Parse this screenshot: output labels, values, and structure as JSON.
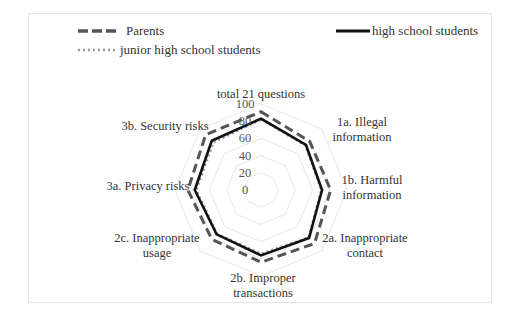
{
  "chart_data": {
    "type": "radar",
    "title": "",
    "categories": [
      "total 21 questions",
      "1a. Illegal information",
      "1b. Harmful information",
      "2a. Inappropriate contact",
      "2b. Improper transactions",
      "2c. Inappropriate usage",
      "3a. Privacy risks",
      "3b. Security risks"
    ],
    "category_label_lines": [
      [
        "total 21 questions"
      ],
      [
        "1a. Illegal",
        "information"
      ],
      [
        "1b. Harmful",
        "information"
      ],
      [
        "2a. Inappropriate",
        "contact"
      ],
      [
        "2b. Improper",
        "transactions"
      ],
      [
        "2c. Inappropriate",
        "usage"
      ],
      [
        "3a. Privacy risks"
      ],
      [
        "3b. Security risks"
      ]
    ],
    "series": [
      {
        "name": "Parents",
        "style": "dashed",
        "color": "#555555",
        "values": [
          91,
          80,
          81,
          88,
          84,
          81,
          85,
          91
        ]
      },
      {
        "name": "high school students",
        "style": "solid",
        "color": "#111111",
        "values": [
          83,
          74,
          71,
          79,
          76,
          73,
          77,
          81
        ]
      },
      {
        "name": "junior high school students",
        "style": "dotted",
        "color": "#999999",
        "values": [
          82,
          73,
          70,
          78,
          74,
          72,
          75,
          78
        ]
      }
    ],
    "rlim": [
      0,
      100
    ],
    "r_ticks": [
      "0",
      "20",
      "40",
      "60",
      "80",
      "100"
    ],
    "grid": true,
    "legend_position": "top"
  }
}
